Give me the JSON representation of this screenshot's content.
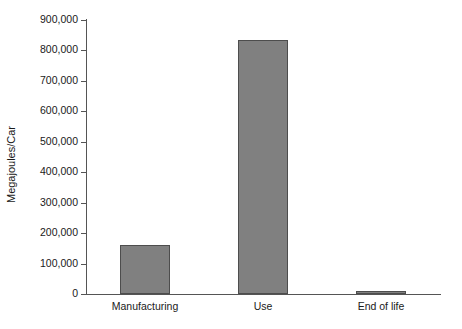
{
  "chart_data": {
    "type": "bar",
    "title": "",
    "subtitle": "",
    "xlabel": "",
    "ylabel": "Megajoules/Car",
    "categories": [
      "Manufacturing",
      "Use",
      "End of life"
    ],
    "values": [
      160000,
      835000,
      5000
    ],
    "series": [
      {
        "name": "Energy use",
        "values": [
          160000,
          835000,
          5000
        ]
      }
    ],
    "ylim": [
      0,
      900000
    ],
    "ytick_values": [
      0,
      100000,
      200000,
      300000,
      400000,
      500000,
      600000,
      700000,
      800000,
      900000
    ],
    "ytick_labels": [
      "0",
      "100,000",
      "200,000",
      "300,000",
      "400,000",
      "500,000",
      "600,000",
      "700,000",
      "800,000",
      "900,000"
    ],
    "grid": false,
    "legend": false,
    "legend_position": "none",
    "annotations": [],
    "bar_color": "#808080",
    "bar_edge_color": "#4d4d4d",
    "axis_color": "#555555",
    "text_color": "#1a1a1a",
    "background_color": "#ffffff"
  }
}
